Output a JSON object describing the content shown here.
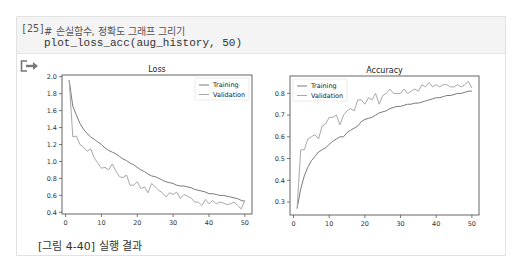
{
  "cell": {
    "execution_count": "[25]",
    "code_lines": [
      "# 손실함수, 정확도 그래프 그리기",
      "plot_loss_acc(aug_history, 50)"
    ],
    "output_icon": "output-redirect-icon"
  },
  "caption": "[그림 4-40] 실행 결과",
  "colors": {
    "training": "#7a7a7a",
    "validation": "#a8a8a8",
    "axis": "#555555"
  },
  "chart_data": [
    {
      "type": "line",
      "title": "Loss",
      "xlabel": "",
      "ylabel": "",
      "xlim": [
        -1,
        52
      ],
      "ylim": [
        0.38,
        2.02
      ],
      "xticks": [
        0,
        10,
        20,
        30,
        40,
        50
      ],
      "yticks": [
        0.4,
        0.6,
        0.8,
        1.0,
        1.2,
        1.4,
        1.6,
        1.8,
        2.0
      ],
      "ytick_labels": [
        "0.4",
        "0.6",
        "0.8",
        "1.0",
        "1.2",
        "1.4",
        "1.6",
        "1.8",
        "2.0"
      ],
      "legend": {
        "position": "upper right",
        "entries": [
          "Training",
          "Validation"
        ]
      },
      "grid": false,
      "x": [
        1,
        2,
        3,
        4,
        5,
        6,
        7,
        8,
        9,
        10,
        11,
        12,
        13,
        14,
        15,
        16,
        17,
        18,
        19,
        20,
        21,
        22,
        23,
        24,
        25,
        26,
        27,
        28,
        29,
        30,
        31,
        32,
        33,
        34,
        35,
        36,
        37,
        38,
        39,
        40,
        41,
        42,
        43,
        44,
        45,
        46,
        47,
        48,
        49,
        50
      ],
      "series": [
        {
          "name": "Training",
          "values": [
            1.96,
            1.65,
            1.55,
            1.45,
            1.38,
            1.33,
            1.29,
            1.26,
            1.23,
            1.2,
            1.16,
            1.13,
            1.11,
            1.09,
            1.06,
            1.03,
            1.01,
            0.98,
            0.96,
            0.93,
            0.9,
            0.88,
            0.85,
            0.83,
            0.82,
            0.8,
            0.78,
            0.76,
            0.75,
            0.74,
            0.72,
            0.71,
            0.71,
            0.7,
            0.69,
            0.67,
            0.66,
            0.65,
            0.64,
            0.62,
            0.62,
            0.61,
            0.6,
            0.6,
            0.59,
            0.58,
            0.57,
            0.56,
            0.54,
            0.53
          ]
        },
        {
          "name": "Validation",
          "values": [
            1.95,
            1.29,
            1.3,
            1.2,
            1.17,
            1.12,
            1.15,
            1.04,
            0.98,
            0.92,
            0.93,
            0.9,
            0.97,
            0.89,
            0.82,
            0.81,
            0.84,
            0.72,
            0.72,
            0.76,
            0.68,
            0.7,
            0.63,
            0.74,
            0.7,
            0.66,
            0.63,
            0.58,
            0.63,
            0.61,
            0.64,
            0.56,
            0.61,
            0.59,
            0.57,
            0.52,
            0.52,
            0.48,
            0.55,
            0.5,
            0.54,
            0.5,
            0.52,
            0.51,
            0.49,
            0.5,
            0.52,
            0.48,
            0.44,
            0.54
          ]
        }
      ]
    },
    {
      "type": "line",
      "title": "Accuracy",
      "xlabel": "",
      "ylabel": "",
      "xlim": [
        -1,
        52
      ],
      "ylim": [
        0.24,
        0.88
      ],
      "xticks": [
        0,
        10,
        20,
        30,
        40,
        50
      ],
      "yticks": [
        0.3,
        0.4,
        0.5,
        0.6,
        0.7,
        0.8
      ],
      "ytick_labels": [
        "0.3",
        "0.4",
        "0.5",
        "0.6",
        "0.7",
        "0.8"
      ],
      "legend": {
        "position": "upper left",
        "entries": [
          "Training",
          "Validation"
        ]
      },
      "grid": false,
      "x": [
        1,
        2,
        3,
        4,
        5,
        6,
        7,
        8,
        9,
        10,
        11,
        12,
        13,
        14,
        15,
        16,
        17,
        18,
        19,
        20,
        21,
        22,
        23,
        24,
        25,
        26,
        27,
        28,
        29,
        30,
        31,
        32,
        33,
        34,
        35,
        36,
        37,
        38,
        39,
        40,
        41,
        42,
        43,
        44,
        45,
        46,
        47,
        48,
        49,
        50
      ],
      "series": [
        {
          "name": "Training",
          "values": [
            0.27,
            0.36,
            0.42,
            0.46,
            0.49,
            0.51,
            0.53,
            0.54,
            0.55,
            0.565,
            0.58,
            0.59,
            0.6,
            0.6,
            0.62,
            0.63,
            0.64,
            0.65,
            0.67,
            0.68,
            0.685,
            0.69,
            0.7,
            0.71,
            0.715,
            0.72,
            0.73,
            0.735,
            0.74,
            0.74,
            0.745,
            0.75,
            0.75,
            0.755,
            0.755,
            0.76,
            0.765,
            0.77,
            0.775,
            0.78,
            0.78,
            0.785,
            0.79,
            0.79,
            0.795,
            0.8,
            0.8,
            0.805,
            0.81,
            0.81
          ]
        },
        {
          "name": "Validation",
          "values": [
            0.27,
            0.54,
            0.54,
            0.59,
            0.6,
            0.61,
            0.59,
            0.65,
            0.66,
            0.69,
            0.69,
            0.7,
            0.655,
            0.7,
            0.72,
            0.73,
            0.72,
            0.77,
            0.77,
            0.75,
            0.78,
            0.77,
            0.8,
            0.75,
            0.79,
            0.8,
            0.82,
            0.8,
            0.8,
            0.8,
            0.82,
            0.8,
            0.81,
            0.82,
            0.81,
            0.84,
            0.83,
            0.85,
            0.83,
            0.84,
            0.83,
            0.84,
            0.84,
            0.83,
            0.83,
            0.84,
            0.83,
            0.84,
            0.855,
            0.825
          ]
        }
      ]
    }
  ]
}
